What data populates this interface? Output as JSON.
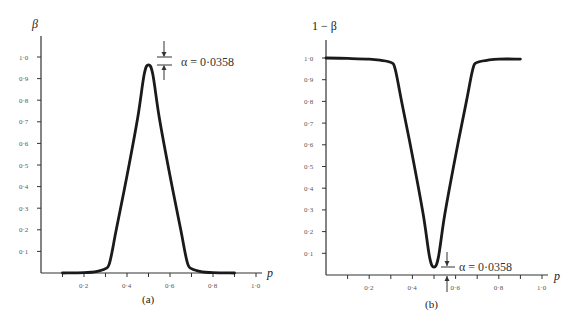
{
  "figure": {
    "panel_a": {
      "label": "(a)",
      "ylabel": "β",
      "xlabel": "p",
      "annotation": "α = 0·0358",
      "ytick_labels": [
        "0·1",
        "0·2",
        "0·3",
        "0·4",
        "0·5",
        "0·6",
        "0·7",
        "0·8",
        "0·9",
        "1·0"
      ],
      "xtick_labels": [
        "0·2",
        "0·4",
        "0·6",
        "0·8",
        "1·0"
      ]
    },
    "panel_b": {
      "label": "(b)",
      "ylabel": "1 − β",
      "xlabel": "p",
      "annotation": "α = 0·0358",
      "ytick_labels": [
        "0·1",
        "0·2",
        "0·3",
        "0·4",
        "0·5",
        "0·6",
        "0·7",
        "0·8",
        "0·9",
        "1·0"
      ],
      "xtick_labels": [
        "0·2",
        "0·4",
        "0·6",
        "0·8",
        "1·0"
      ]
    }
  },
  "chart_data": [
    {
      "type": "line",
      "title": "(a)",
      "xlabel": "p",
      "ylabel": "β",
      "xlim": [
        0,
        1.0
      ],
      "ylim": [
        0,
        1.0
      ],
      "grid": false,
      "x_ticks": [
        0.1,
        0.2,
        0.3,
        0.4,
        0.5,
        0.6,
        0.7,
        0.8,
        0.9,
        1.0
      ],
      "x_tick_labels": [
        "0·2",
        "0·4",
        "0·6",
        "0·8",
        "1·0"
      ],
      "y_ticks": [
        0.1,
        0.2,
        0.3,
        0.4,
        0.5,
        0.6,
        0.7,
        0.8,
        0.9,
        1.0
      ],
      "annotation": {
        "text": "α = 0·0358",
        "at": [
          0.5,
          0.964
        ],
        "meaning": "gap between peak and 1·0"
      },
      "series": [
        {
          "name": "β",
          "x": [
            0.1,
            0.2,
            0.25,
            0.3,
            0.32,
            0.35,
            0.4,
            0.45,
            0.48,
            0.5,
            0.52,
            0.55,
            0.6,
            0.65,
            0.68,
            0.7,
            0.75,
            0.8,
            0.9
          ],
          "values": [
            0.0,
            0.002,
            0.005,
            0.02,
            0.05,
            0.2,
            0.45,
            0.72,
            0.92,
            0.964,
            0.92,
            0.72,
            0.45,
            0.2,
            0.05,
            0.02,
            0.005,
            0.002,
            0.0
          ]
        }
      ]
    },
    {
      "type": "line",
      "title": "(b)",
      "xlabel": "p",
      "ylabel": "1 − β",
      "xlim": [
        0,
        1.0
      ],
      "ylim": [
        0,
        1.0
      ],
      "grid": false,
      "x_ticks": [
        0.1,
        0.2,
        0.3,
        0.4,
        0.5,
        0.6,
        0.7,
        0.8,
        0.9,
        1.0
      ],
      "x_tick_labels": [
        "0·2",
        "0·4",
        "0·6",
        "0·8",
        "1·0"
      ],
      "y_ticks": [
        0.1,
        0.2,
        0.3,
        0.4,
        0.5,
        0.6,
        0.7,
        0.8,
        0.9,
        1.0
      ],
      "annotation": {
        "text": "α = 0·0358",
        "at": [
          0.5,
          0.036
        ],
        "meaning": "gap between minimum and 0"
      },
      "series": [
        {
          "name": "1 − β",
          "x": [
            0.0,
            0.1,
            0.2,
            0.25,
            0.3,
            0.32,
            0.35,
            0.4,
            0.45,
            0.48,
            0.5,
            0.52,
            0.55,
            0.6,
            0.65,
            0.68,
            0.7,
            0.75,
            0.8,
            0.9
          ],
          "values": [
            1.0,
            0.998,
            0.995,
            0.99,
            0.98,
            0.95,
            0.8,
            0.55,
            0.28,
            0.08,
            0.036,
            0.08,
            0.28,
            0.55,
            0.8,
            0.95,
            0.98,
            0.99,
            0.995,
            0.995
          ]
        }
      ]
    }
  ]
}
